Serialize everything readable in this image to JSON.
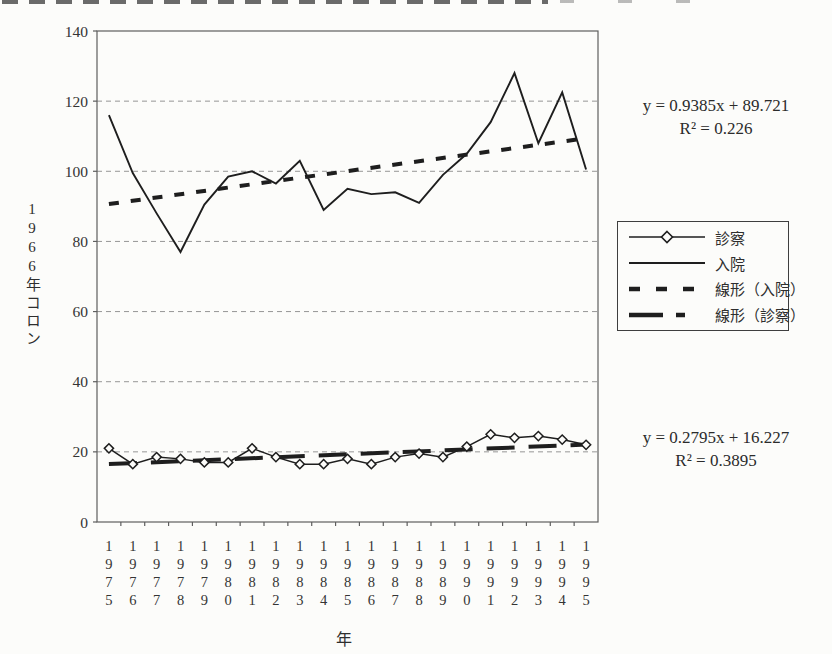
{
  "chart_data": {
    "type": "line",
    "title": "",
    "xlabel": "年",
    "ylabel": "1966年コロン",
    "x": [
      "1975",
      "1976",
      "1977",
      "1978",
      "1979",
      "1980",
      "1981",
      "1982",
      "1983",
      "1984",
      "1985",
      "1986",
      "1987",
      "1988",
      "1989",
      "1990",
      "1991",
      "1992",
      "1993",
      "1994",
      "1995"
    ],
    "series": [
      {
        "name": "診察",
        "marker": "open-diamond",
        "values": [
          21,
          16.5,
          18.5,
          18,
          17,
          17,
          21,
          18.5,
          16.5,
          16.5,
          18,
          16.5,
          18.5,
          19.5,
          18.5,
          21.5,
          25,
          24,
          24.5,
          23.5,
          22
        ]
      },
      {
        "name": "入院",
        "marker": "none",
        "values": [
          116,
          99.5,
          88,
          77,
          90.5,
          98.5,
          100,
          96.5,
          103,
          89,
          95,
          93.5,
          94,
          91,
          99,
          105,
          114,
          128,
          108,
          122.5,
          100.5
        ]
      }
    ],
    "trendlines": [
      {
        "name": "線形（入院）",
        "slope": 0.9385,
        "intercept": 89.721,
        "style": "bold-dash"
      },
      {
        "name": "線形（診察）",
        "slope": 0.2795,
        "intercept": 16.227,
        "style": "bold-longdash"
      }
    ],
    "ylim": [
      0,
      140
    ],
    "ytick_step": 20,
    "grid": true,
    "legend_position": "right"
  },
  "axes": {
    "y_title": "1966年コロン",
    "x_title": "年",
    "y_ticks": [
      "140",
      "120",
      "100",
      "80",
      "60",
      "40",
      "20",
      "0"
    ]
  },
  "annotations": {
    "upper": {
      "line1": "y = 0.9385x + 89.721",
      "line2": "R² = 0.226"
    },
    "lower": {
      "line1": "y = 0.2795x + 16.227",
      "line2": "R² = 0.3895"
    }
  },
  "legend": {
    "items": [
      {
        "label": "診察",
        "swatch": "line-diamond"
      },
      {
        "label": "入院",
        "swatch": "line"
      },
      {
        "label": "線形（入院）",
        "swatch": "bold-dash"
      },
      {
        "label": "線形（診察）",
        "swatch": "bold-longdash"
      }
    ]
  },
  "colors": {
    "ink": "#1e1e1e",
    "grid": "#969696",
    "frame": "#5e5e5e",
    "paper": "#fcfcfa"
  }
}
